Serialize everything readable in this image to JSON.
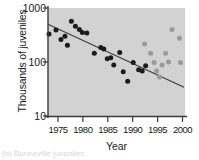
{
  "chart_data": {
    "type": "scatter",
    "title": "",
    "xlabel": "Year",
    "ylabel": "Thousands of juveniles",
    "yscale": "log",
    "ylim": [
      10,
      1000
    ],
    "xlim": [
      1973,
      2000.5
    ],
    "grid": false,
    "legend": "none",
    "yticks": [
      10,
      100,
      1000
    ],
    "ytick_labels": [
      "10",
      "100",
      "1000"
    ],
    "xticks": [
      1975,
      1980,
      1985,
      1990,
      1995,
      2000
    ],
    "xtick_labels": [
      "1975",
      "1980",
      "1985",
      "1990",
      "1995",
      "2000"
    ],
    "series": [
      {
        "name": "observed-black",
        "color": "#1c1c1c",
        "marker": "circle",
        "points": [
          {
            "x": 1973.2,
            "y": 330
          },
          {
            "x": 1974.6,
            "y": 390
          },
          {
            "x": 1975.6,
            "y": 260
          },
          {
            "x": 1976.4,
            "y": 300
          },
          {
            "x": 1976.9,
            "y": 205
          },
          {
            "x": 1977.7,
            "y": 570
          },
          {
            "x": 1978.5,
            "y": 460
          },
          {
            "x": 1979.3,
            "y": 400
          },
          {
            "x": 1979.9,
            "y": 350
          },
          {
            "x": 1980.8,
            "y": 345
          },
          {
            "x": 1982.3,
            "y": 145
          },
          {
            "x": 1983.6,
            "y": 185
          },
          {
            "x": 1984.2,
            "y": 175
          },
          {
            "x": 1984.9,
            "y": 115
          },
          {
            "x": 1985.6,
            "y": 120
          },
          {
            "x": 1986.2,
            "y": 88
          },
          {
            "x": 1987.4,
            "y": 150
          },
          {
            "x": 1988.1,
            "y": 66
          },
          {
            "x": 1989.0,
            "y": 44
          },
          {
            "x": 1990.1,
            "y": 98
          },
          {
            "x": 1991.2,
            "y": 72
          },
          {
            "x": 1991.9,
            "y": 68
          },
          {
            "x": 1992.6,
            "y": 85
          }
        ]
      },
      {
        "name": "observed-gray",
        "color": "#9a9a9a",
        "marker": "circle",
        "points": [
          {
            "x": 1992.4,
            "y": 215
          },
          {
            "x": 1993.6,
            "y": 145
          },
          {
            "x": 1994.3,
            "y": 98
          },
          {
            "x": 1994.8,
            "y": 68
          },
          {
            "x": 1995.4,
            "y": 53
          },
          {
            "x": 1995.9,
            "y": 88
          },
          {
            "x": 1996.6,
            "y": 145
          },
          {
            "x": 1997.2,
            "y": 100
          },
          {
            "x": 1997.9,
            "y": 400
          },
          {
            "x": 1999.4,
            "y": 275
          },
          {
            "x": 1999.6,
            "y": 98
          }
        ]
      }
    ],
    "trendline": {
      "name": "fitted-decline",
      "color": "#3a3a3a",
      "x0": 1973.0,
      "y0": 500,
      "x1": 2000.3,
      "y1": 34
    }
  },
  "figure": {
    "caption_fragment": "(b) Bonneville juveniles"
  }
}
